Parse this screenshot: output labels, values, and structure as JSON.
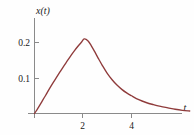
{
  "figure": {
    "background_color": "#fefefe",
    "axis_color": "#8a8a8a",
    "text_color": "#1a1a1a"
  },
  "labels": {
    "y_axis_label": "x(t)",
    "x_axis_label": "t",
    "y_tick_0_2": "0.2",
    "y_tick_0_1": "0.1",
    "x_tick_2": "2",
    "x_tick_4": "4"
  },
  "chart_data": {
    "type": "line",
    "title": "",
    "xlabel": "t",
    "ylabel": "x(t)",
    "curve_color": "#8f3b3b",
    "grid": false,
    "legend": null,
    "xlim": [
      0,
      6.4
    ],
    "ylim": [
      0,
      0.245
    ],
    "xticks": [
      2,
      4
    ],
    "xtick_labels": [
      "2",
      "4"
    ],
    "yticks": [
      0.1,
      0.2
    ],
    "ytick_labels": [
      "0.1",
      "0.2"
    ],
    "peak": {
      "x": 2.05,
      "y": 0.21
    },
    "series": [
      {
        "name": "x(t)",
        "x": [
          0.0,
          0.15,
          0.3,
          0.45,
          0.6,
          0.75,
          0.9,
          1.05,
          1.2,
          1.35,
          1.5,
          1.65,
          1.8,
          1.95,
          2.05,
          2.2,
          2.35,
          2.5,
          2.65,
          2.8,
          3.0,
          3.2,
          3.4,
          3.6,
          3.8,
          4.0,
          4.3,
          4.6,
          4.9,
          5.2,
          5.5,
          5.8,
          6.1,
          6.4
        ],
        "y": [
          0.0,
          0.016,
          0.033,
          0.05,
          0.068,
          0.085,
          0.101,
          0.117,
          0.133,
          0.148,
          0.163,
          0.177,
          0.19,
          0.202,
          0.21,
          0.205,
          0.19,
          0.172,
          0.153,
          0.135,
          0.113,
          0.095,
          0.08,
          0.068,
          0.058,
          0.05,
          0.039,
          0.031,
          0.025,
          0.02,
          0.016,
          0.012,
          0.009,
          0.007
        ]
      }
    ]
  }
}
